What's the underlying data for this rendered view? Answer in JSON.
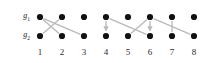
{
  "figure": {
    "title": "",
    "background_color": "#ffffff",
    "width": 213,
    "height": 63
  },
  "rows": [
    {
      "id": "g1",
      "name": "g",
      "subscript": "1",
      "label": "g",
      "y": 17
    },
    {
      "id": "g2",
      "name": "g",
      "subscript": "2",
      "label": "g",
      "y": 36
    }
  ],
  "columns": [
    {
      "label": "1",
      "x": 40
    },
    {
      "label": "2",
      "x": 62
    },
    {
      "label": "3",
      "x": 84
    },
    {
      "label": "4",
      "x": 106
    },
    {
      "label": "5",
      "x": 128
    },
    {
      "label": "6",
      "x": 150
    },
    {
      "label": "7",
      "x": 172
    },
    {
      "label": "8",
      "x": 194
    }
  ],
  "chart_data": {
    "type": "scatter",
    "title": "",
    "xlabel": "",
    "ylabel": "",
    "grid": false,
    "legend": false,
    "node_color": "#111111",
    "node_radius": 3.1,
    "edge_color": "#b9b9b9",
    "edge_width": 1.3,
    "row_ids": [
      "g1",
      "g2"
    ],
    "x_tick_labels": [
      "1",
      "2",
      "3",
      "4",
      "5",
      "6",
      "7",
      "8"
    ],
    "nodes": [
      {
        "row": "g1",
        "col": 1
      },
      {
        "row": "g1",
        "col": 2
      },
      {
        "row": "g1",
        "col": 3
      },
      {
        "row": "g1",
        "col": 4
      },
      {
        "row": "g1",
        "col": 5
      },
      {
        "row": "g1",
        "col": 6
      },
      {
        "row": "g1",
        "col": 7
      },
      {
        "row": "g1",
        "col": 8
      },
      {
        "row": "g2",
        "col": 1
      },
      {
        "row": "g2",
        "col": 2
      },
      {
        "row": "g2",
        "col": 3
      },
      {
        "row": "g2",
        "col": 4
      },
      {
        "row": "g2",
        "col": 5
      },
      {
        "row": "g2",
        "col": 6
      },
      {
        "row": "g2",
        "col": 7
      },
      {
        "row": "g2",
        "col": 8
      }
    ],
    "edges": [
      {
        "from_row": "g1",
        "from_col": 1,
        "to_row": "g2",
        "to_col": 2,
        "arrow": false
      },
      {
        "from_row": "g1",
        "from_col": 1,
        "to_row": "g2",
        "to_col": 3,
        "arrow": false
      },
      {
        "from_row": "g1",
        "from_col": 2,
        "to_row": "g2",
        "to_col": 1,
        "arrow": false
      },
      {
        "from_row": "g1",
        "from_col": 4,
        "to_row": "g2",
        "to_col": 4,
        "arrow": true
      },
      {
        "from_row": "g1",
        "from_col": 4,
        "to_row": "g2",
        "to_col": 6,
        "arrow": false
      },
      {
        "from_row": "g1",
        "from_col": 6,
        "to_row": "g2",
        "to_col": 5,
        "arrow": false
      },
      {
        "from_row": "g1",
        "from_col": 6,
        "to_row": "g2",
        "to_col": 6,
        "arrow": true
      },
      {
        "from_row": "g1",
        "from_col": 6,
        "to_row": "g2",
        "to_col": 8,
        "arrow": false
      },
      {
        "from_row": "g1",
        "from_col": 7,
        "to_row": "g2",
        "to_col": 7,
        "arrow": false
      }
    ]
  }
}
